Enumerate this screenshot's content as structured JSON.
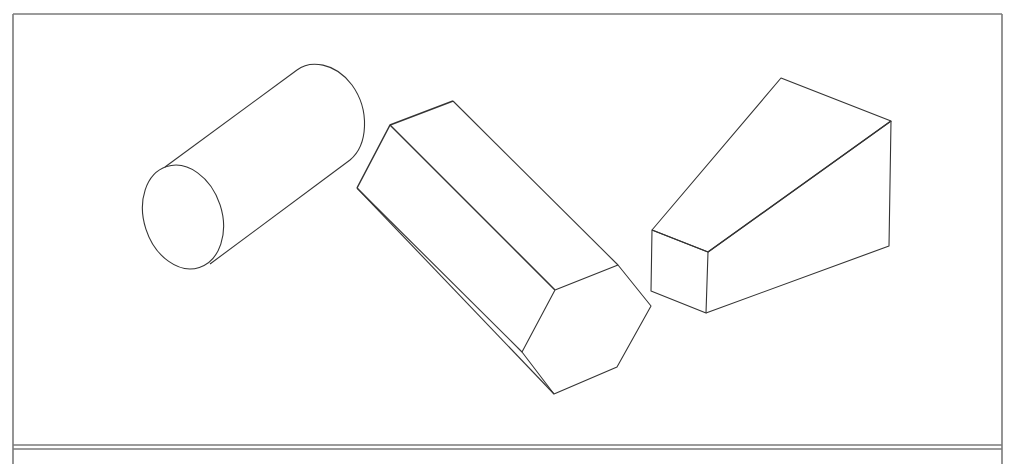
{
  "diagram": {
    "type": "isometric-solids-line-drawing",
    "colors": {
      "background": "#ffffff",
      "stroke": "#333333",
      "frame": "#7a7a7a"
    },
    "frame": {
      "left": 13,
      "top": 14,
      "right": 1002,
      "bottom_line_1": 445,
      "bottom_line_2": 449
    },
    "shapes": [
      {
        "name": "cylinder",
        "front_ellipse": {
          "cx": 183,
          "cy": 217,
          "rx": 39,
          "ry": 53,
          "rotate": -18
        },
        "back_ellipse": {
          "cx": 315,
          "cy": 120,
          "rx": 39,
          "ry": 53,
          "rotate": -18
        },
        "silhouette_lines": [
          [
            165,
            167,
            297,
            70
          ],
          [
            210,
            264,
            350,
            160
          ]
        ]
      },
      {
        "name": "hexagonal-prism",
        "front_face": [
          [
            555,
            290
          ],
          [
            618,
            265
          ],
          [
            651,
            306
          ],
          [
            617,
            367
          ],
          [
            554,
            394
          ],
          [
            522,
            352
          ]
        ],
        "back_vertices": [
          [
            390,
            125
          ],
          [
            453,
            101
          ],
          [
            357,
            188
          ]
        ],
        "edges": [
          [
            453,
            101,
            618,
            265
          ],
          [
            390,
            125,
            555,
            290
          ],
          [
            357,
            188,
            522,
            352
          ],
          [
            357,
            188,
            554,
            394
          ]
        ]
      },
      {
        "name": "wedge",
        "vertices": {
          "apex": [
            781,
            78
          ],
          "back_top_right": [
            891,
            121
          ],
          "back_bottom_right": [
            889,
            246
          ],
          "front_top_left": [
            652,
            230
          ],
          "front_top_right": [
            708,
            252
          ],
          "front_bottom_left": [
            651,
            291
          ],
          "front_bottom_right": [
            706,
            313
          ]
        }
      }
    ]
  }
}
